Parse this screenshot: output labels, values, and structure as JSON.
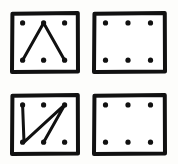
{
  "figure": {
    "background_color": "#fdfdfb",
    "ink_color": "#111111",
    "panel_fill": "#ffffff",
    "border_width_px": 4,
    "dot_radius_px": 2.6,
    "stroke_width_px": 3,
    "rows": 2,
    "columns": 2,
    "panel_count": 4,
    "grid_dot_rows": 2,
    "grid_dot_columns": 3,
    "dots_per_panel": 6
  },
  "dot_layout": {
    "columns_pct": [
      18,
      48,
      78
    ],
    "rows_pct": [
      19,
      78
    ],
    "labels": [
      "top-left",
      "top-center",
      "top-right",
      "bottom-left",
      "bottom-center",
      "bottom-right"
    ]
  },
  "panels": [
    {
      "id": "panel-top-left",
      "position": "top-left",
      "has_path": true,
      "path_name": "inverted-v-peak",
      "path_description": "Line from bottom-left dot up to top-center dot, then down to bottom-right dot",
      "path_points": [
        "bottom-left",
        "top-center",
        "bottom-right"
      ],
      "path_d": "M 18 78 L 48 19 L 78 78",
      "dots": [
        {
          "label": "top-left",
          "x": 18,
          "y": 19
        },
        {
          "label": "top-center",
          "x": 48,
          "y": 19
        },
        {
          "label": "top-right",
          "x": 78,
          "y": 19
        },
        {
          "label": "bottom-left",
          "x": 18,
          "y": 78
        },
        {
          "label": "bottom-center",
          "x": 48,
          "y": 78
        },
        {
          "label": "bottom-right",
          "x": 78,
          "y": 78
        }
      ]
    },
    {
      "id": "panel-top-right",
      "position": "top-right",
      "has_path": false,
      "path_name": "none",
      "path_description": "Empty dot grid, no connecting lines",
      "path_points": [],
      "path_d": "",
      "dots": [
        {
          "label": "top-left",
          "x": 18,
          "y": 19
        },
        {
          "label": "top-center",
          "x": 48,
          "y": 19
        },
        {
          "label": "top-right",
          "x": 78,
          "y": 19
        },
        {
          "label": "bottom-left",
          "x": 18,
          "y": 78
        },
        {
          "label": "bottom-center",
          "x": 48,
          "y": 78
        },
        {
          "label": "bottom-right",
          "x": 78,
          "y": 78
        }
      ]
    },
    {
      "id": "panel-bottom-left",
      "position": "bottom-left",
      "has_path": true,
      "path_name": "zigzag-v-then-diagonal",
      "path_description": "Line from top-left dot down to bottom-left dot, up to top-right dot, then down to bottom-center dot",
      "path_points": [
        "top-left",
        "bottom-left",
        "top-right",
        "bottom-center"
      ],
      "path_d": "M 18 19 L 20 78 L 78 19 L 48 78",
      "dots": [
        {
          "label": "top-left",
          "x": 18,
          "y": 19
        },
        {
          "label": "top-center",
          "x": 48,
          "y": 19
        },
        {
          "label": "top-right",
          "x": 78,
          "y": 19
        },
        {
          "label": "bottom-left",
          "x": 18,
          "y": 78
        },
        {
          "label": "bottom-center",
          "x": 48,
          "y": 78
        },
        {
          "label": "bottom-right",
          "x": 78,
          "y": 78
        }
      ]
    },
    {
      "id": "panel-bottom-right",
      "position": "bottom-right",
      "has_path": false,
      "path_name": "none",
      "path_description": "Empty dot grid, no connecting lines",
      "path_points": [],
      "path_d": "",
      "dots": [
        {
          "label": "top-left",
          "x": 18,
          "y": 19
        },
        {
          "label": "top-center",
          "x": 48,
          "y": 19
        },
        {
          "label": "top-right",
          "x": 78,
          "y": 19
        },
        {
          "label": "bottom-left",
          "x": 18,
          "y": 78
        },
        {
          "label": "bottom-center",
          "x": 48,
          "y": 78
        },
        {
          "label": "bottom-right",
          "x": 78,
          "y": 78
        }
      ]
    }
  ]
}
